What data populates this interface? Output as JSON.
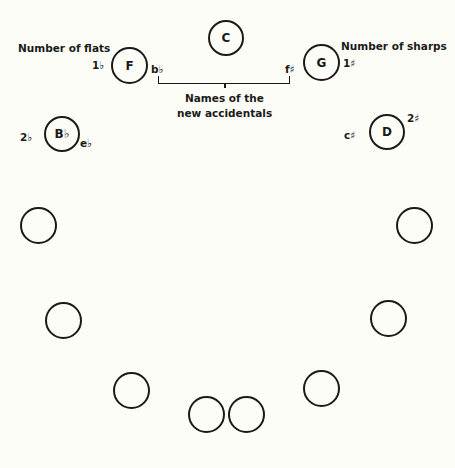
{
  "diagram": {
    "keys": [
      {
        "name": "C",
        "accidental_count": "",
        "new_accidental": ""
      },
      {
        "name": "F",
        "accidental_count": "1♭",
        "new_accidental": "b♭"
      },
      {
        "name": "G",
        "accidental_count": "1♯",
        "new_accidental": "f♯"
      },
      {
        "name": "B♭",
        "accidental_count": "2♭",
        "new_accidental": "e♭"
      },
      {
        "name": "D",
        "accidental_count": "2♯",
        "new_accidental": "c♯"
      }
    ],
    "labels": {
      "flats": "Number of flats",
      "sharps": "Number of sharps",
      "accidentals_line1": "Names of the",
      "accidentals_line2": "new accidentals"
    },
    "empty_circles": 8
  }
}
